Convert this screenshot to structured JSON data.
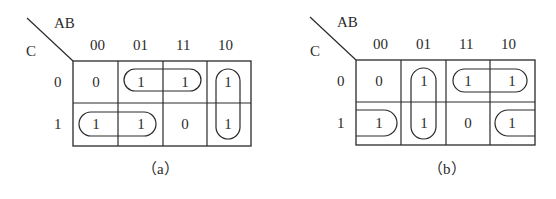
{
  "maps": [
    {
      "id": "a",
      "caption": "（a）",
      "row_var": "C",
      "col_var": "AB",
      "col_labels": [
        "00",
        "01",
        "11",
        "10"
      ],
      "row_labels": [
        "0",
        "1"
      ],
      "cells": [
        [
          "0",
          "1",
          "1",
          "1"
        ],
        [
          "1",
          "1",
          "0",
          "1"
        ]
      ],
      "groups": [
        {
          "cells": [
            [
              0,
              1
            ],
            [
              0,
              2
            ]
          ],
          "shape": "horizontal"
        },
        {
          "cells": [
            [
              1,
              0
            ],
            [
              1,
              1
            ]
          ],
          "shape": "horizontal"
        },
        {
          "cells": [
            [
              0,
              3
            ],
            [
              1,
              3
            ]
          ],
          "shape": "vertical"
        }
      ]
    },
    {
      "id": "b",
      "caption": "（b）",
      "row_var": "C",
      "col_var": "AB",
      "col_labels": [
        "00",
        "01",
        "11",
        "10"
      ],
      "row_labels": [
        "0",
        "1"
      ],
      "cells": [
        [
          "0",
          "1",
          "1",
          "1"
        ],
        [
          "1",
          "1",
          "0",
          "1"
        ]
      ],
      "groups": [
        {
          "cells": [
            [
              0,
              1
            ],
            [
              1,
              1
            ]
          ],
          "shape": "vertical"
        },
        {
          "cells": [
            [
              0,
              2
            ],
            [
              0,
              3
            ]
          ],
          "shape": "horizontal"
        },
        {
          "cells": [
            [
              1,
              0
            ],
            [
              1,
              3
            ]
          ],
          "shape": "wrap-around"
        }
      ]
    }
  ]
}
